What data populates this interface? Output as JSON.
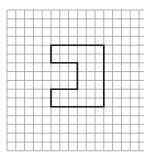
{
  "diagram": {
    "type": "grid-with-polygon",
    "background": "#ffffff",
    "grid": {
      "origin_x": 7,
      "origin_y": 10,
      "cell_size": 8.8,
      "columns": 16,
      "rows": 16,
      "line_color": "#9a9a9a",
      "line_width": 0.8
    },
    "shape": {
      "name": "notched-rectangle",
      "stroke_color": "#1a1a1a",
      "stroke_width": 1.6,
      "vertices_grid_units": [
        [
          5,
          4
        ],
        [
          11,
          4
        ],
        [
          11,
          11
        ],
        [
          5,
          11
        ],
        [
          5,
          9
        ],
        [
          8,
          9
        ],
        [
          8,
          6
        ],
        [
          5,
          6
        ]
      ]
    }
  }
}
